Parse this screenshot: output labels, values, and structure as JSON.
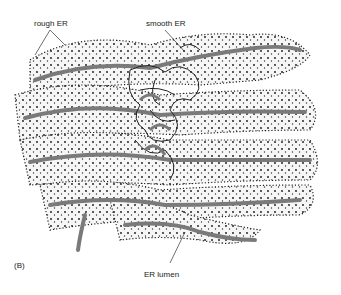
{
  "figure": {
    "panel_label": "(B)",
    "labels": {
      "rough_er": "rough ER",
      "smooth_er": "smooth ER",
      "er_lumen": "ER lumen"
    },
    "colors": {
      "lumen": "#7a7a7a",
      "membrane_fill": "#f4f4f4",
      "ribosome": "#111111",
      "outline": "#222222"
    }
  }
}
